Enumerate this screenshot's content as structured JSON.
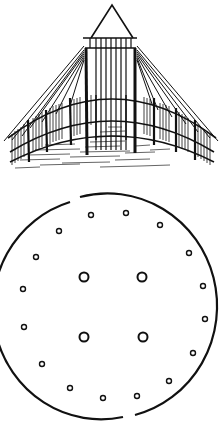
{
  "figures": [
    {
      "id": "tent-elevation",
      "description": "Perspective line drawing of a conical tent-like structure with a pyramidal top, central square frame of vertical bars, radiating rafters and a curved slatted fence wall on hatched ground"
    },
    {
      "id": "ground-plan",
      "description": "Circular ground plan with two entrance gaps (top-left and bottom), four large central posts and sixteen small perimeter posts",
      "colors": {
        "ink": "#111111",
        "paper": "#ffffff"
      },
      "outer_circle": {
        "cx": 113,
        "cy": 116,
        "rx": 108,
        "ry": 111
      },
      "gaps": [
        {
          "position": "top-left",
          "x_range": [
            70,
            80
          ]
        },
        {
          "position": "bottom",
          "x_range": [
            123,
            135
          ]
        }
      ],
      "large_posts": [
        {
          "cx": 84,
          "cy": 87
        },
        {
          "cx": 142,
          "cy": 87
        },
        {
          "cx": 84,
          "cy": 147
        },
        {
          "cx": 143,
          "cy": 147
        }
      ],
      "small_posts": [
        {
          "cx": 91,
          "cy": 25
        },
        {
          "cx": 126,
          "cy": 23
        },
        {
          "cx": 160,
          "cy": 35
        },
        {
          "cx": 189,
          "cy": 63
        },
        {
          "cx": 203,
          "cy": 96
        },
        {
          "cx": 205,
          "cy": 129
        },
        {
          "cx": 193,
          "cy": 163
        },
        {
          "cx": 169,
          "cy": 191
        },
        {
          "cx": 137,
          "cy": 206
        },
        {
          "cx": 103,
          "cy": 208
        },
        {
          "cx": 70,
          "cy": 198
        },
        {
          "cx": 42,
          "cy": 174
        },
        {
          "cx": 24,
          "cy": 137
        },
        {
          "cx": 23,
          "cy": 99
        },
        {
          "cx": 36,
          "cy": 67
        },
        {
          "cx": 59,
          "cy": 41
        }
      ]
    }
  ]
}
